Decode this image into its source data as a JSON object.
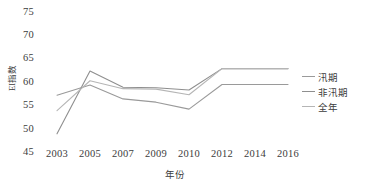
{
  "chart_data": {
    "type": "line",
    "title": "",
    "xlabel": "年份",
    "ylabel": "EI指数",
    "x": [
      2003,
      2005,
      2007,
      2009,
      2010,
      2012,
      2014,
      2016
    ],
    "xticklabels": [
      "2003",
      "2005",
      "2007",
      "2009",
      "2010",
      "2012",
      "2014",
      "2016"
    ],
    "yticks": [
      45,
      50,
      55,
      60,
      65,
      70,
      75
    ],
    "yticklabels": [
      "45",
      "50",
      "55",
      "60",
      "65",
      "70",
      "75"
    ],
    "ylim": [
      45,
      75
    ],
    "grid": false,
    "legend_position": "right",
    "series": [
      {
        "name": "汛期",
        "color": "#9a9a9a",
        "values": [
          57.3,
          59.5,
          56.5,
          55.8,
          54.3,
          59.6,
          59.6,
          59.6
        ]
      },
      {
        "name": "非汛期",
        "color": "#8f8f8f",
        "values": [
          49.0,
          62.5,
          59.0,
          58.9,
          58.4,
          63.0,
          63.0,
          63.0
        ]
      },
      {
        "name": "全年",
        "color": "#b5b5b5",
        "values": [
          54.0,
          60.4,
          58.7,
          58.6,
          57.4,
          63.0,
          63.0,
          63.0
        ]
      }
    ]
  },
  "legend": {
    "items": [
      {
        "label": "汛期",
        "color": "#9a9a9a"
      },
      {
        "label": "非汛期",
        "color": "#8f8f8f"
      },
      {
        "label": "全年",
        "color": "#b5b5b5"
      }
    ]
  },
  "axes": {
    "y_title": "EI指数",
    "x_title": "年份"
  }
}
